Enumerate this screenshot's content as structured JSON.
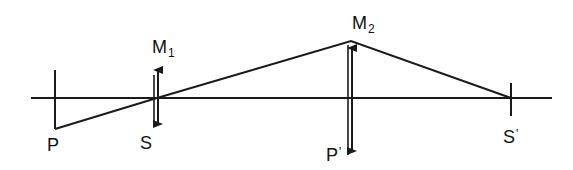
{
  "diagram": {
    "type": "optical ray diagram",
    "stroke_color": "#1a1a1a",
    "background": "#ffffff",
    "axis": {
      "x1": 31,
      "x2": 552,
      "y": 98
    },
    "labels": {
      "P": {
        "main": "P",
        "sub": ""
      },
      "S": {
        "main": "S",
        "sub": ""
      },
      "M1": {
        "main": "M",
        "sub": "1"
      },
      "M2": {
        "main": "M",
        "sub": "2"
      },
      "P_prime": {
        "main": "P",
        "sup": "'"
      },
      "S_prime": {
        "main": "S",
        "sup": "'"
      }
    },
    "elements": {
      "object_P": {
        "x": 55,
        "y_top": 70,
        "y_bottom": 129
      },
      "lens_M1": {
        "x": 158,
        "y_top": 63,
        "y_bottom": 131
      },
      "lens_M2": {
        "x": 351,
        "y_top": 41,
        "y_bottom": 158
      },
      "image_S_prime": {
        "x": 511,
        "y_top": 83,
        "y_bottom": 116
      }
    },
    "ray": [
      [
        55,
        129
      ],
      [
        157,
        98
      ],
      [
        351,
        41
      ],
      [
        511,
        98
      ]
    ]
  }
}
